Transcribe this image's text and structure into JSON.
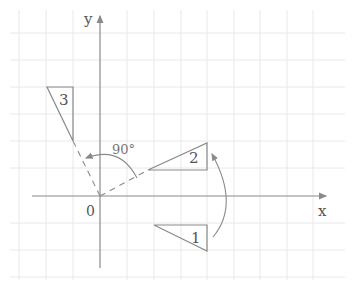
{
  "figure": {
    "axes": {
      "x_label": "x",
      "y_label": "y",
      "origin_label": "0"
    },
    "angle_label": "90°",
    "triangles": [
      {
        "id": "1",
        "label": "1"
      },
      {
        "id": "2",
        "label": "2"
      },
      {
        "id": "3",
        "label": "3"
      }
    ],
    "colors": {
      "grid": "#e6e6e6",
      "axis": "#8a8a8a",
      "shape": "#8a8a8a",
      "text": "#555555"
    }
  }
}
